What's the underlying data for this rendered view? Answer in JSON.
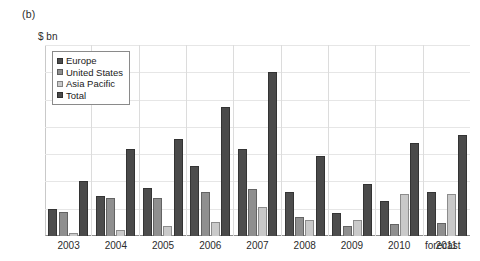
{
  "panel": {
    "label": "(b)"
  },
  "axis": {
    "unit_label": "$ bn",
    "y_ticks": [
      "700",
      "600",
      "500",
      "400",
      "300",
      "200",
      "100",
      "0"
    ],
    "forecast_label": "forecast"
  },
  "legend": {
    "items": [
      {
        "label": "Europe",
        "color": "#4d4d4d"
      },
      {
        "label": "United States",
        "color": "#8f8f8f"
      },
      {
        "label": "Asia Pacific",
        "color": "#c9c9c9"
      },
      {
        "label": "Total",
        "color": "#4a4a4a"
      }
    ]
  },
  "chart_data": {
    "type": "bar",
    "title": "(b)",
    "xlabel": "",
    "ylabel": "$ bn",
    "ylim": [
      0,
      700
    ],
    "yticks": [
      0,
      100,
      200,
      300,
      400,
      500,
      600,
      700
    ],
    "grid": true,
    "legend_position": "top-left-inside",
    "categories": [
      "2003",
      "2004",
      "2005",
      "2006",
      "2007",
      "2008",
      "2009",
      "2010",
      "2011"
    ],
    "annotations": [
      "forecast"
    ],
    "series": [
      {
        "name": "Europe",
        "color": "#4d4d4d",
        "values": [
          100,
          145,
          175,
          255,
          320,
          163,
          85,
          128,
          160
        ]
      },
      {
        "name": "United States",
        "color": "#8f8f8f",
        "values": [
          88,
          138,
          138,
          163,
          172,
          68,
          35,
          45,
          48
        ]
      },
      {
        "name": "Asia Pacific",
        "color": "#c9c9c9",
        "values": [
          12,
          22,
          38,
          50,
          105,
          60,
          58,
          155,
          155
        ]
      },
      {
        "name": "Total",
        "color": "#4a4a4a",
        "values": [
          200,
          320,
          355,
          473,
          600,
          295,
          192,
          340,
          372
        ]
      }
    ]
  }
}
